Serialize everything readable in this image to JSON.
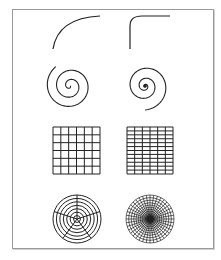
{
  "figure": {
    "stroke_color": "#222222",
    "frame_color": "#9a9a9a",
    "rows": [
      {
        "name": "arc",
        "left": "smooth quarter arc",
        "right": "arc with sharp corner"
      },
      {
        "name": "spiral",
        "left": "spiral",
        "right": "spiral compressed toward center"
      },
      {
        "name": "cartesian-grid",
        "left": {
          "cols": 6,
          "rows": 6
        },
        "right": {
          "cols": 6,
          "rows": 12
        }
      },
      {
        "name": "polar-grid",
        "left": {
          "rings": 7,
          "spokes": 5
        },
        "right": {
          "rings": 14,
          "spokes": 40
        }
      }
    ]
  }
}
